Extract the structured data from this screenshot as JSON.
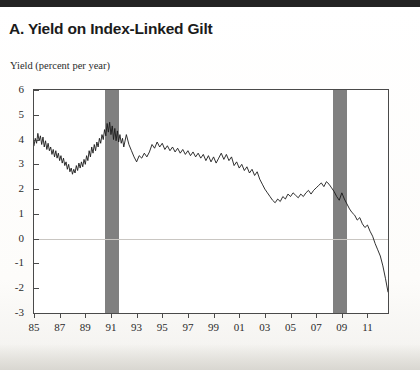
{
  "title": "A. Yield on Index-Linked Gilt",
  "axis_note": "Yield (percent per year)",
  "colors": {
    "line": "#1a1a1a",
    "recession_band": "#808080",
    "frame": "#4a4a4a",
    "zero_line": "#c9c6c2",
    "page_background": "#ffffff"
  },
  "chart_data": {
    "type": "line",
    "title": "A. Yield on Index-Linked Gilt",
    "xlabel": "",
    "ylabel": "Yield (percent per year)",
    "xlim": [
      1985.0,
      2012.6
    ],
    "ylim": [
      -3,
      6
    ],
    "ytick_labels": [
      "6",
      "5",
      "4",
      "3",
      "2",
      "1",
      "0",
      "-1",
      "-2",
      "-3"
    ],
    "ytick_values": [
      6,
      5,
      4,
      3,
      2,
      1,
      0,
      -1,
      -2,
      -3
    ],
    "xtick_labels": [
      "85",
      "87",
      "89",
      "91",
      "93",
      "95",
      "97",
      "99",
      "01",
      "03",
      "05",
      "07",
      "09",
      "11"
    ],
    "xtick_values": [
      1985,
      1987,
      1989,
      1991,
      1993,
      1995,
      1997,
      1999,
      2001,
      2003,
      2005,
      2007,
      2009,
      2011
    ],
    "grid": false,
    "legend": null,
    "zero_reference_line": 0,
    "shaded_regions": [
      {
        "label": "recession",
        "x_start": 1990.5,
        "x_end": 1991.6
      },
      {
        "label": "recession",
        "x_start": 2008.3,
        "x_end": 2009.4
      }
    ],
    "series": [
      {
        "name": "Index-linked gilt yield",
        "x": [
          1985.0,
          1985.1,
          1985.2,
          1985.3,
          1985.4,
          1985.5,
          1985.6,
          1985.7,
          1985.8,
          1985.9,
          1986.0,
          1986.1,
          1986.2,
          1986.3,
          1986.4,
          1986.5,
          1986.6,
          1986.7,
          1986.8,
          1986.9,
          1987.0,
          1987.1,
          1987.2,
          1987.3,
          1987.4,
          1987.5,
          1987.6,
          1987.7,
          1987.8,
          1987.9,
          1988.0,
          1988.1,
          1988.2,
          1988.3,
          1988.4,
          1988.5,
          1988.6,
          1988.7,
          1988.8,
          1988.9,
          1989.0,
          1989.1,
          1989.2,
          1989.3,
          1989.4,
          1989.5,
          1989.6,
          1989.7,
          1989.8,
          1989.9,
          1990.0,
          1990.1,
          1990.2,
          1990.3,
          1990.4,
          1990.5,
          1990.6,
          1990.7,
          1990.8,
          1990.9,
          1991.0,
          1991.1,
          1991.2,
          1991.3,
          1991.4,
          1991.5,
          1991.6,
          1991.7,
          1991.8,
          1991.9,
          1992.0,
          1992.2,
          1992.4,
          1992.6,
          1992.8,
          1993.0,
          1993.2,
          1993.4,
          1993.6,
          1993.8,
          1994.0,
          1994.2,
          1994.4,
          1994.6,
          1994.8,
          1995.0,
          1995.2,
          1995.4,
          1995.6,
          1995.8,
          1996.0,
          1996.2,
          1996.4,
          1996.6,
          1996.8,
          1997.0,
          1997.2,
          1997.4,
          1997.6,
          1997.8,
          1998.0,
          1998.2,
          1998.4,
          1998.6,
          1998.8,
          1999.0,
          1999.2,
          1999.4,
          1999.6,
          1999.8,
          2000.0,
          2000.2,
          2000.4,
          2000.6,
          2000.8,
          2001.0,
          2001.2,
          2001.4,
          2001.6,
          2001.8,
          2002.0,
          2002.2,
          2002.4,
          2002.6,
          2002.8,
          2003.0,
          2003.2,
          2003.4,
          2003.6,
          2003.8,
          2004.0,
          2004.2,
          2004.4,
          2004.6,
          2004.8,
          2005.0,
          2005.2,
          2005.4,
          2005.6,
          2005.8,
          2006.0,
          2006.2,
          2006.4,
          2006.6,
          2006.8,
          2007.0,
          2007.2,
          2007.4,
          2007.6,
          2007.8,
          2008.0,
          2008.2,
          2008.4,
          2008.6,
          2008.8,
          2009.0,
          2009.2,
          2009.4,
          2009.6,
          2009.8,
          2010.0,
          2010.2,
          2010.4,
          2010.6,
          2010.8,
          2011.0,
          2011.2,
          2011.4,
          2011.6,
          2011.8,
          2012.0,
          2012.2,
          2012.4,
          2012.6
        ],
        "y": [
          3.75,
          4.05,
          3.85,
          4.25,
          3.95,
          4.15,
          3.8,
          4.1,
          3.7,
          3.95,
          3.6,
          3.85,
          3.55,
          3.7,
          3.4,
          3.6,
          3.3,
          3.55,
          3.25,
          3.45,
          3.15,
          3.35,
          3.05,
          3.25,
          2.95,
          3.1,
          2.8,
          3.0,
          2.7,
          2.85,
          2.6,
          2.8,
          2.65,
          2.95,
          2.75,
          3.05,
          2.85,
          3.1,
          2.9,
          3.2,
          3.0,
          3.35,
          3.15,
          3.55,
          3.3,
          3.7,
          3.45,
          3.8,
          3.55,
          3.9,
          3.7,
          4.05,
          3.85,
          4.2,
          4.0,
          4.4,
          4.15,
          4.65,
          4.3,
          4.7,
          4.2,
          4.55,
          4.0,
          4.45,
          3.95,
          4.35,
          3.9,
          4.2,
          3.85,
          4.05,
          3.7,
          4.2,
          3.8,
          3.55,
          3.3,
          3.1,
          3.35,
          3.25,
          3.45,
          3.3,
          3.5,
          3.8,
          3.65,
          3.9,
          3.7,
          3.85,
          3.6,
          3.75,
          3.55,
          3.7,
          3.5,
          3.65,
          3.45,
          3.6,
          3.4,
          3.55,
          3.35,
          3.5,
          3.3,
          3.45,
          3.25,
          3.4,
          3.15,
          3.35,
          3.1,
          3.3,
          3.05,
          3.25,
          3.45,
          3.2,
          3.4,
          3.15,
          3.3,
          2.95,
          3.1,
          2.85,
          3.0,
          2.75,
          2.9,
          2.65,
          2.8,
          2.55,
          2.7,
          2.4,
          2.2,
          2.0,
          1.85,
          1.7,
          1.55,
          1.45,
          1.6,
          1.5,
          1.7,
          1.6,
          1.8,
          1.7,
          1.85,
          1.75,
          1.65,
          1.8,
          1.7,
          1.85,
          1.95,
          1.8,
          1.95,
          2.05,
          2.15,
          2.25,
          2.1,
          2.3,
          2.2,
          2.05,
          1.9,
          1.7,
          1.55,
          1.85,
          1.6,
          1.4,
          1.2,
          1.05,
          0.95,
          0.75,
          0.85,
          0.6,
          0.45,
          0.55,
          0.3,
          0.1,
          -0.2,
          -0.45,
          -0.7,
          -1.1,
          -1.6,
          -2.15
        ]
      }
    ]
  }
}
